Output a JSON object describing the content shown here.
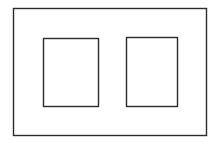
{
  "diagram": {
    "stroke_color": "#2b2b2b",
    "background": "#ffffff",
    "outer_frame": {
      "x": 13,
      "y": 8,
      "width": 193,
      "height": 127
    },
    "panels": [
      {
        "name": "left-panel",
        "x": 43,
        "y": 38,
        "width": 55,
        "height": 68
      },
      {
        "name": "right-panel",
        "x": 126,
        "y": 37,
        "width": 51,
        "height": 69
      }
    ]
  }
}
